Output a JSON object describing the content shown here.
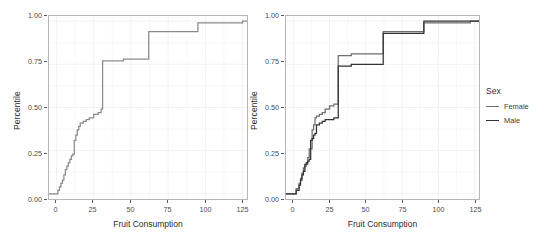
{
  "chart_data": [
    {
      "type": "line",
      "subtype": "ecdf-step",
      "panel": "left",
      "title": "",
      "xlabel": "Fruit Consumption",
      "ylabel": "Percentile",
      "xlim": [
        -5,
        128
      ],
      "ylim": [
        -0.03,
        1.03
      ],
      "xticks": [
        0,
        25,
        50,
        75,
        100,
        125
      ],
      "yticks": [
        0.0,
        0.25,
        0.5,
        0.75,
        1.0
      ],
      "xticklabels": [
        "0",
        "25",
        "50",
        "75",
        "100",
        "125"
      ],
      "yticklabels": [
        "0.00",
        "0.25",
        "0.50",
        "0.75",
        "1.00"
      ],
      "grid": true,
      "legend": "none",
      "series": [
        {
          "name": "All",
          "color": "#8a8a8a",
          "x": [
            -5,
            0,
            1,
            2,
            3,
            4,
            5,
            6,
            7,
            8,
            9,
            10,
            11,
            12,
            13,
            14,
            15,
            16,
            18,
            20,
            22,
            25,
            28,
            30,
            31,
            40,
            45,
            60,
            62,
            90,
            95,
            120,
            125,
            128
          ],
          "y": [
            0.0,
            0.0,
            0.02,
            0.04,
            0.06,
            0.08,
            0.11,
            0.14,
            0.16,
            0.18,
            0.2,
            0.22,
            0.23,
            0.31,
            0.34,
            0.37,
            0.39,
            0.41,
            0.42,
            0.43,
            0.44,
            0.46,
            0.47,
            0.49,
            0.77,
            0.77,
            0.78,
            0.78,
            0.94,
            0.94,
            0.99,
            0.99,
            1.0,
            1.0
          ]
        }
      ]
    },
    {
      "type": "line",
      "subtype": "ecdf-step",
      "panel": "right",
      "title": "",
      "xlabel": "Fruit Consumption",
      "ylabel": "Percentile",
      "xlim": [
        -5,
        128
      ],
      "ylim": [
        -0.03,
        1.03
      ],
      "xticks": [
        0,
        25,
        50,
        75,
        100,
        125
      ],
      "yticks": [
        0.0,
        0.25,
        0.5,
        0.75,
        1.0
      ],
      "xticklabels": [
        "0",
        "25",
        "50",
        "75",
        "100",
        "125"
      ],
      "yticklabels": [
        "0.00",
        "0.25",
        "0.50",
        "0.75",
        "1.00"
      ],
      "grid": true,
      "legend": "right",
      "legend_title": "Sex",
      "series": [
        {
          "name": "Female",
          "color": "#6e6e6e",
          "x": [
            -5,
            0,
            2,
            4,
            5,
            6,
            7,
            8,
            9,
            10,
            11,
            12,
            13,
            14,
            15,
            16,
            18,
            20,
            22,
            25,
            28,
            30,
            31,
            38,
            40,
            55,
            60,
            62,
            88,
            90,
            92,
            118,
            122,
            128
          ],
          "y": [
            0.0,
            0.0,
            0.03,
            0.06,
            0.09,
            0.12,
            0.15,
            0.16,
            0.17,
            0.21,
            0.26,
            0.26,
            0.37,
            0.4,
            0.44,
            0.45,
            0.46,
            0.47,
            0.49,
            0.51,
            0.52,
            0.52,
            0.8,
            0.8,
            0.81,
            0.81,
            0.81,
            0.94,
            0.94,
            0.99,
            0.99,
            0.99,
            1.0,
            1.0
          ]
        },
        {
          "name": "Male",
          "color": "#333333",
          "x": [
            -5,
            0,
            2,
            4,
            5,
            6,
            7,
            8,
            9,
            10,
            11,
            12,
            13,
            14,
            15,
            16,
            18,
            20,
            22,
            25,
            28,
            30,
            31,
            38,
            40,
            55,
            60,
            62,
            88,
            90,
            92,
            118,
            122,
            128
          ],
          "y": [
            0.0,
            0.0,
            0.02,
            0.05,
            0.08,
            0.11,
            0.13,
            0.17,
            0.18,
            0.19,
            0.2,
            0.31,
            0.32,
            0.34,
            0.35,
            0.4,
            0.41,
            0.42,
            0.43,
            0.43,
            0.44,
            0.44,
            0.74,
            0.74,
            0.75,
            0.75,
            0.75,
            0.93,
            0.93,
            1.0,
            1.0,
            1.0,
            1.0,
            1.0
          ]
        }
      ]
    }
  ],
  "axes": {
    "xlabel": "Fruit Consumption",
    "ylabel": "Percentile",
    "xticklabels": [
      "0",
      "25",
      "50",
      "75",
      "100",
      "125"
    ],
    "yticklabels": [
      "0.00",
      "0.25",
      "0.50",
      "0.75",
      "1.00"
    ]
  },
  "legend": {
    "title": "Sex",
    "items": [
      {
        "label": "Female",
        "color": "#6e6e6e"
      },
      {
        "label": "Male",
        "color": "#333333"
      }
    ]
  },
  "style": {
    "background": "#ffffff",
    "panel_border": "#b6b6b6",
    "grid_color": "#f0f0f0",
    "tick_color": "#5a5a5a",
    "text_color": "#2b2b2b"
  }
}
